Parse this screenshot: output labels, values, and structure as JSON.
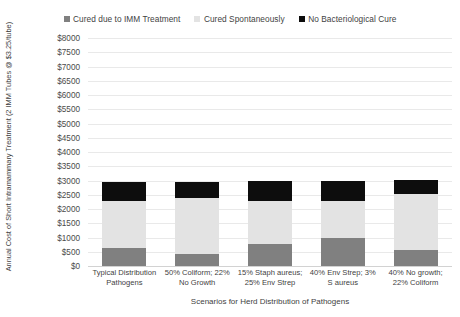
{
  "chart_data": {
    "type": "bar",
    "subtype": "stacked-column",
    "title": "",
    "xlabel": "Scenarios for Herd Distribution of Pathogens",
    "ylabel": "Annual Cost of Short Intramammary Treatment (2 IMM Tubes @ $3.25/tube)",
    "ylim": [
      0,
      8000
    ],
    "ytick_step": 500,
    "ytick_labels": [
      "$0",
      "$500",
      "$1000",
      "$1500",
      "$2000",
      "$2500",
      "$3000",
      "$3500",
      "$4000",
      "$4500",
      "$5000",
      "$5500",
      "$6000",
      "$6500",
      "$7000",
      "$7500",
      "$8000"
    ],
    "grid": true,
    "legend_position": "top",
    "categories": [
      "Typical Distribution Pathogens",
      "50% Coliform; 22% No Growth",
      "15% Staph aureus; 25% Env Strep",
      "40% Env Strep; 3% S aureus",
      "40% No growth; 22% Coliform"
    ],
    "category_lines": [
      [
        "Typical Distribution",
        "Pathogens"
      ],
      [
        "50% Coliform; 22%",
        "No Growth"
      ],
      [
        "15% Staph aureus;",
        "25% Env Strep"
      ],
      [
        "40% Env Strep; 3%",
        "S aureus"
      ],
      [
        "40% No growth;",
        "22% Coliform"
      ]
    ],
    "series": [
      {
        "name": "Cured due to IMM Treatment",
        "color": "#808080",
        "values": [
          630,
          420,
          790,
          1000,
          570
        ]
      },
      {
        "name": "Cured Spontaneously",
        "color": "#e3e3e3",
        "values": [
          1640,
          1980,
          1480,
          1280,
          1960
        ]
      },
      {
        "name": "No Bacteriological Cure",
        "color": "#0d0d0d",
        "values": [
          670,
          540,
          700,
          720,
          480
        ]
      }
    ],
    "totals": [
      2940,
      2940,
      2970,
      3000,
      3010
    ]
  },
  "legend": {
    "items": [
      {
        "label": "Cured due to IMM Treatment",
        "color": "#808080"
      },
      {
        "label": "Cured Spontaneously",
        "color": "#e3e3e3"
      },
      {
        "label": "No Bacteriological Cure",
        "color": "#0d0d0d"
      }
    ]
  }
}
